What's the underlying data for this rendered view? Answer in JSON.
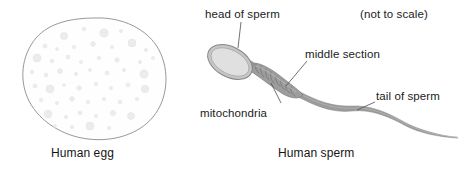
{
  "figure": {
    "background_color": "#ffffff",
    "width": 465,
    "height": 172
  },
  "labels": {
    "head_of_sperm": "head of sperm",
    "not_to_scale": "(not to scale)",
    "middle_section": "middle section",
    "mitochondria": "mitochondria",
    "tail_of_sperm": "tail of sperm"
  },
  "captions": {
    "egg": "Human egg",
    "sperm": "Human sperm"
  },
  "colors": {
    "outline": "#8c8c8c",
    "granule_fill": "#ececec",
    "granule_edge": "#e0e0e0",
    "head_rim": "#9a9a9a",
    "head_fill": "#dcdcdc",
    "midpiece": "#8f8f8f",
    "tail": "#9b9b9b",
    "leader_line": "#5a5a5a",
    "text": "#1a1a1a"
  },
  "diagram": {
    "egg": {
      "name": "Human egg",
      "shape": "irregular rounded cell outline with scattered cytoplasmic granules",
      "granule_count": 52
    },
    "sperm": {
      "name": "Human sperm",
      "parts": [
        "head of sperm",
        "middle section",
        "mitochondria",
        "tail of sperm"
      ]
    }
  }
}
